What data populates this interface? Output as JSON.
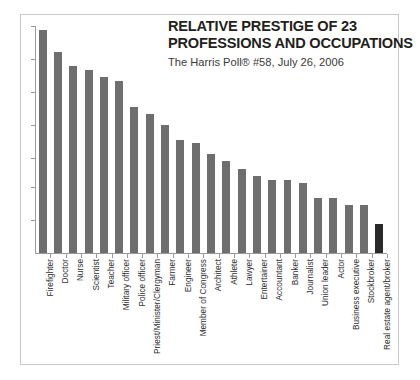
{
  "chart_data": {
    "type": "bar",
    "title": "RELATIVE PRESTIGE OF 23 PROFESSIONS AND OCCUPATIONS",
    "title_line1": "RELATIVE PRESTIGE OF 23",
    "title_line2": "PROFESSIONS AND OCCUPATIONS",
    "subtitle": "The Harris Poll® #58, July 26, 2006",
    "xlabel": "",
    "ylabel": "",
    "ylim": [
      0,
      62
    ],
    "ytick_values": [
      0,
      9,
      18,
      26,
      35,
      44,
      53,
      62
    ],
    "ytick_labels": [
      "",
      "",
      "",
      "",
      "",
      "",
      "",
      ""
    ],
    "grid": false,
    "legend": "none",
    "categories": [
      "Firefighter",
      "Doctor",
      "Nurse",
      "Scientist",
      "Teacher",
      "Military officer",
      "Police officer",
      "Priest/Minister/Clergyman",
      "Farmer",
      "Engineer",
      "Member of Congress",
      "Architect",
      "Athlete",
      "Lawyer",
      "Entertainer",
      "Accountant",
      "Banker",
      "Journalist",
      "Union leader",
      "Actor",
      "Business executive",
      "Stockbroker",
      "Real estate agent/broker"
    ],
    "values": [
      61,
      55,
      51,
      50,
      48,
      47,
      40,
      38,
      35,
      31,
      30,
      27,
      25,
      23,
      21,
      20,
      20,
      19,
      15,
      15,
      13,
      13,
      8
    ],
    "bar_colors": [
      "#6e6e6e",
      "#6e6e6e",
      "#6e6e6e",
      "#6e6e6e",
      "#6e6e6e",
      "#6e6e6e",
      "#6e6e6e",
      "#6e6e6e",
      "#6e6e6e",
      "#6e6e6e",
      "#6e6e6e",
      "#6e6e6e",
      "#6e6e6e",
      "#6e6e6e",
      "#6e6e6e",
      "#6e6e6e",
      "#6e6e6e",
      "#6e6e6e",
      "#6e6e6e",
      "#6e6e6e",
      "#6e6e6e",
      "#6e6e6e",
      "#2a2a2a"
    ],
    "accent_category": "Real estate agent/broker",
    "colors": {
      "bar": "#6e6e6e",
      "accent_bar": "#2a2a2a",
      "axis": "#9a9a9a",
      "frame": "#c9c9c9",
      "title_text": "#231f20",
      "subtitle_text": "#3a3a3a",
      "label_text": "#2e2e2e",
      "background": "#ffffff"
    }
  }
}
